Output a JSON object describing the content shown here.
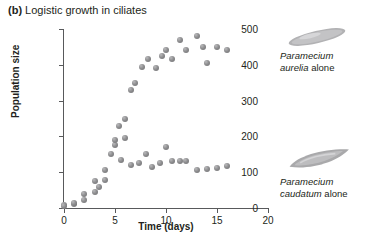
{
  "figure": {
    "panel_letter": "(b)",
    "title": "Logistic growth in ciliates"
  },
  "axes": {
    "x_title": "Time (days)",
    "y_title": "Population size",
    "x_ticks": [
      "0",
      "5",
      "10",
      "15",
      "20"
    ],
    "y_ticks": [
      "0",
      "100",
      "200",
      "300",
      "400",
      "500"
    ]
  },
  "annotations": {
    "aurelia": {
      "species": "Paramecium",
      "epithet": "aurelia",
      "suffix": " alone"
    },
    "caudatum": {
      "species": "Paramecium",
      "epithet": "caudatum",
      "suffix": " alone"
    }
  },
  "colors": {
    "marker": "#8e8e90",
    "axis": "#58595b",
    "text": "#231f20",
    "ciliate": "#a6a6a8"
  },
  "chart_data": {
    "type": "scatter",
    "title": "Logistic growth in ciliates",
    "xlabel": "Time (days)",
    "ylabel": "Population size",
    "xlim": [
      0,
      20
    ],
    "ylim": [
      0,
      500
    ],
    "xticks": [
      0,
      5,
      10,
      15,
      20
    ],
    "yticks": [
      0,
      100,
      200,
      300,
      400,
      500
    ],
    "grid": false,
    "legend": "inline annotations at right",
    "series": [
      {
        "name": "Paramecium aurelia alone",
        "points": [
          [
            0,
            8
          ],
          [
            1,
            12
          ],
          [
            2,
            22
          ],
          [
            3,
            45
          ],
          [
            4,
            105
          ],
          [
            4.6,
            150
          ],
          [
            5,
            175
          ],
          [
            5.4,
            230
          ],
          [
            6,
            250
          ],
          [
            6.6,
            330
          ],
          [
            7,
            350
          ],
          [
            7.6,
            395
          ],
          [
            8.2,
            415
          ],
          [
            9,
            390
          ],
          [
            9.6,
            425
          ],
          [
            10,
            440
          ],
          [
            10.6,
            415
          ],
          [
            11.4,
            470
          ],
          [
            12,
            440
          ],
          [
            13,
            480
          ],
          [
            13.6,
            450
          ],
          [
            14,
            405
          ],
          [
            15,
            450
          ],
          [
            16,
            440
          ]
        ]
      },
      {
        "name": "Paramecium caudatum alone",
        "points": [
          [
            0,
            6
          ],
          [
            1,
            15
          ],
          [
            2,
            40
          ],
          [
            3,
            75
          ],
          [
            3.4,
            58
          ],
          [
            4,
            78
          ],
          [
            5,
            190
          ],
          [
            5.6,
            135
          ],
          [
            6,
            195
          ],
          [
            6.6,
            120
          ],
          [
            7.4,
            125
          ],
          [
            8,
            150
          ],
          [
            8.6,
            115
          ],
          [
            9.4,
            125
          ],
          [
            10,
            170
          ],
          [
            10.6,
            130
          ],
          [
            11.4,
            130
          ],
          [
            12,
            132
          ],
          [
            13,
            105
          ],
          [
            14,
            108
          ],
          [
            15,
            112
          ],
          [
            16,
            118
          ]
        ]
      }
    ]
  }
}
